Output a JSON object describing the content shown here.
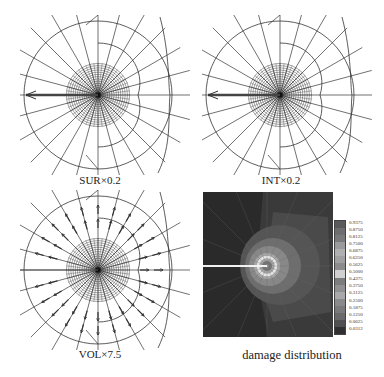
{
  "figure": {
    "panels": [
      {
        "id": "sur",
        "caption": "SUR×0.2",
        "type": "mesh-surface-vectors",
        "arrow_direction": "left"
      },
      {
        "id": "int",
        "caption": "INT×0.2",
        "type": "mesh-interior-vectors",
        "arrow_direction": "left"
      },
      {
        "id": "vol",
        "caption": "VOL×7.5",
        "type": "mesh-volume-vectors",
        "arrow_direction": "radial"
      },
      {
        "id": "damage",
        "caption": "damage distribution",
        "type": "contour-map"
      }
    ],
    "colorbar": {
      "labels": [
        "0.9375",
        "0.8750",
        "0.8125",
        "0.7500",
        "0.6875",
        "0.6250",
        "0.5625",
        "0.5000",
        "0.4375",
        "0.3750",
        "0.3125",
        "0.2500",
        "0.1875",
        "0.1250",
        "0.0625",
        "0.0312"
      ],
      "colors": [
        "#5a5a5a",
        "#6e6e6e",
        "#7a7a7a",
        "#9a9a9a",
        "#b0b0b0",
        "#a0a0a0",
        "#8c8c8c",
        "#d0d0d0",
        "#7c7c7c",
        "#909090",
        "#a8a8a8",
        "#8a8a8a",
        "#7a7a7a",
        "#6a6a6a",
        "#505050",
        "#303030"
      ]
    },
    "colors": {
      "mesh": "#333333",
      "background": "#ffffff",
      "damage_bg": "#2a2a2a"
    }
  }
}
